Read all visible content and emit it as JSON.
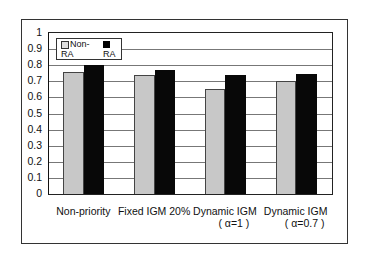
{
  "chart_data": {
    "type": "bar",
    "title": "",
    "xlabel": "",
    "ylabel": "",
    "ylim": [
      0,
      1
    ],
    "yticks": [
      "0",
      "0.1",
      "0.2",
      "0.3",
      "0.4",
      "0.5",
      "0.6",
      "0.7",
      "0.8",
      "0.9",
      "1"
    ],
    "grid": true,
    "legend_position": "top-left inside",
    "categories": [
      "Non-priority",
      "Fixed IGM 20%",
      "Dynamic IGM (α=1 )",
      "Dynamic IGM (α=0.7)"
    ],
    "category_lines": [
      [
        "Non-priority",
        ""
      ],
      [
        "Fixed IGM 20%",
        ""
      ],
      [
        "Dynamic IGM",
        "( α=1  )"
      ],
      [
        "Dynamic IGM",
        "( α=0.7 )"
      ]
    ],
    "series": [
      {
        "name": "Non-RA",
        "color": "#c8c8c8",
        "values": [
          0.76,
          0.74,
          0.65,
          0.7
        ]
      },
      {
        "name": "RA",
        "color": "#080808",
        "values": [
          0.8,
          0.77,
          0.74,
          0.745
        ]
      }
    ]
  }
}
